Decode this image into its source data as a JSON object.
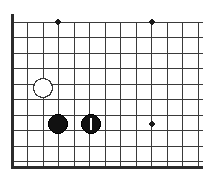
{
  "figure": {
    "kind": "go-board-diagram",
    "title": "Go board corner position",
    "width": 203,
    "height": 183,
    "background_color": "#ffffff"
  },
  "board": {
    "board_size": 19,
    "visible_corner": "bottom-left",
    "origin_x": 12,
    "origin_y": 22,
    "cell_size": 15.5,
    "columns_visible": 13,
    "rows_visible": 10,
    "line_color": "#3a3a3a",
    "line_width": 1,
    "edge_color": "#2b2b2b",
    "edge_width": 3,
    "edges": {
      "left": true,
      "bottom": true,
      "top": false,
      "right": false
    },
    "left_edge_x": 12,
    "bottom_edge_y": 167,
    "grid_right_x": 203,
    "grid_top_y": 22
  },
  "star_points": {
    "label": "hoshi",
    "color": "#1a1a1a",
    "radius": 2.6,
    "points": [
      {
        "name": "star-point-a",
        "cx": 58,
        "cy": 22
      },
      {
        "name": "star-point-b",
        "cx": 152,
        "cy": 22
      },
      {
        "name": "star-point-c",
        "cx": 152,
        "cy": 124
      }
    ]
  },
  "stones": {
    "black_fill": "#111111",
    "black_stroke": "#000000",
    "white_fill": "#ffffff",
    "white_stroke": "#3a3a3a",
    "radius": 9.5,
    "marker_color": "#ffffff",
    "items": [
      {
        "name": "white-stone-1",
        "color": "white",
        "cx": 43,
        "cy": 88,
        "marked": false,
        "marker": ""
      },
      {
        "name": "black-stone-1",
        "color": "black",
        "cx": 58,
        "cy": 124,
        "marked": false,
        "marker": ""
      },
      {
        "name": "black-stone-2",
        "color": "black",
        "cx": 91,
        "cy": 124,
        "marked": true,
        "marker": "vertical-bar"
      }
    ]
  },
  "legend": {
    "marked_stone_meaning": "last move",
    "black_count": "2",
    "white_count": "1"
  }
}
